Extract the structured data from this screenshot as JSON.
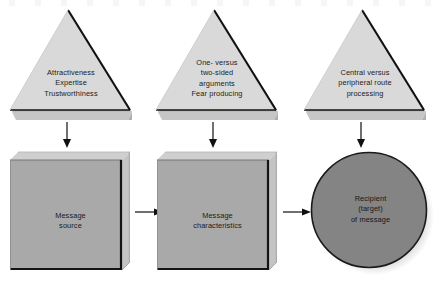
{
  "figure": {
    "type": "flow-diagram",
    "background_color": "#ffffff",
    "colors": {
      "triangle_fill": "#d9d9d9",
      "triangle_edge": "#111111",
      "triangle_base_shade": "#bfbfbf",
      "box_fill": "#a9a9a9",
      "box_top_face": "#cfcfcf",
      "box_side_face": "#c4c4c4",
      "box_edge": "#141414",
      "circle_fill": "#848484",
      "circle_edge": "#1a1a1a",
      "shadow": "#c9c9c9",
      "arrow": "#101010",
      "text": "#1b1b1b"
    }
  },
  "triangles": [
    {
      "id": "source-factors",
      "name": "triangle-source-factors",
      "text": "Attractiveness\nExpertise\nTrustworthiness",
      "lines": [
        "Attractiveness",
        "Expertise",
        "Trustworthiness"
      ]
    },
    {
      "id": "message-factors",
      "name": "triangle-message-factors",
      "text": "One- versus\ntwo-sided\narguments\nFear producing",
      "lines": [
        "One- versus",
        "two-sided",
        "arguments",
        "Fear producing"
      ]
    },
    {
      "id": "recipient-factors",
      "name": "triangle-recipient-factors",
      "text": "Central versus\nperipheral route\nprocessing",
      "lines": [
        "Central versus",
        "peripheral route",
        "processing"
      ]
    }
  ],
  "nodes": [
    {
      "id": "message-source",
      "shape": "box",
      "text": "Message\nsource",
      "lines": [
        "Message",
        "source"
      ]
    },
    {
      "id": "message-characteristics",
      "shape": "box",
      "text": "Message\ncharacteristics",
      "lines": [
        "Message",
        "characteristics"
      ]
    },
    {
      "id": "recipient-of-message",
      "shape": "circle",
      "text": "Recipient\n(target)\nof message",
      "lines": [
        "Recipient",
        "(target)",
        "of message"
      ]
    }
  ],
  "arrows": [
    {
      "id": "a1",
      "from": "source-factors",
      "to": "message-source",
      "direction": "down"
    },
    {
      "id": "a2",
      "from": "message-factors",
      "to": "message-characteristics",
      "direction": "down"
    },
    {
      "id": "a3",
      "from": "recipient-factors",
      "to": "recipient-of-message",
      "direction": "down"
    },
    {
      "id": "a4",
      "from": "message-source",
      "to": "message-characteristics",
      "direction": "right"
    },
    {
      "id": "a5",
      "from": "message-characteristics",
      "to": "recipient-of-message",
      "direction": "right"
    }
  ]
}
